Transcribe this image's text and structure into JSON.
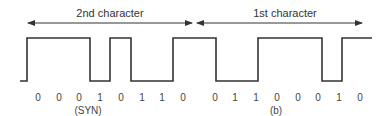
{
  "diagram": {
    "colors": {
      "line": "#333333",
      "text": "#333333",
      "background": "#ffffff"
    },
    "header": {
      "second_character_label": "2nd character",
      "first_character_label": "1st character"
    },
    "bits": [
      "0",
      "0",
      "0",
      "1",
      "0",
      "1",
      "1",
      "0",
      "0",
      "1",
      "1",
      "0",
      "0",
      "0",
      "1",
      "0"
    ],
    "bit_groups": [
      {
        "label": "2nd character",
        "bits": [
          "0",
          "0",
          "0",
          "1",
          "0",
          "1",
          "1",
          "0"
        ],
        "annotation": "(SYN)"
      },
      {
        "label": "1st character",
        "bits": [
          "0",
          "1",
          "1",
          "0",
          "0",
          "0",
          "1",
          "0"
        ],
        "annotation": "(b)"
      }
    ],
    "annotations": {
      "syn": "(SYN)",
      "figure": "(b)"
    }
  }
}
